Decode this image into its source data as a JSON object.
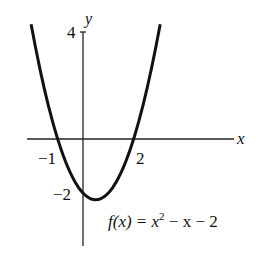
{
  "chart_data": {
    "type": "line",
    "title": "",
    "function_label": "f(x) = x² − x − 2",
    "xlabel": "x",
    "ylabel": "y",
    "x_ticks": [
      {
        "value": -1,
        "label": "−1"
      },
      {
        "value": 2,
        "label": "2"
      }
    ],
    "y_ticks": [
      {
        "value": 4,
        "label": "4"
      },
      {
        "value": -2,
        "label": "−2"
      }
    ],
    "xlim": [
      -2.3,
      6.3
    ],
    "ylim": [
      -4.0,
      4.5
    ],
    "grid": false,
    "series": [
      {
        "name": "f(x) = x^2 - x - 2",
        "x": [
          -2.1,
          -1.5,
          -1,
          -0.5,
          0,
          0.5,
          1,
          1.5,
          2,
          2.5,
          3.05
        ],
        "y": [
          4.31,
          1.75,
          0,
          -1.25,
          -2,
          -2.25,
          -2,
          -1.25,
          0,
          1.75,
          4.25
        ]
      }
    ]
  },
  "labels": {
    "x_axis": "x",
    "y_axis": "y",
    "tick_4": "4",
    "tick_neg2": "−2",
    "tick_neg1": "−1",
    "tick_2": "2",
    "fx": "f(x) = x",
    "exp": "2",
    "rest": " − x − 2"
  }
}
